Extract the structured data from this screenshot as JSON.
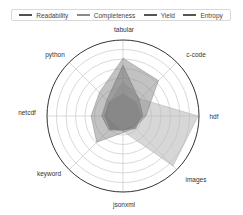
{
  "chart_data": {
    "type": "radar",
    "title": "",
    "categories": [
      "tabular",
      "c-code",
      "hdf",
      "images",
      "jsonxml",
      "keyword",
      "netcdf",
      "python"
    ],
    "rlim": [
      0,
      1
    ],
    "rings": 8,
    "grid": true,
    "legend_position": "top",
    "series": [
      {
        "name": "Readability",
        "color": "#555555",
        "fill": "#5a5a5a",
        "fill_opacity": 0.75,
        "values": [
          0.3,
          0.25,
          0.24,
          0.24,
          0.18,
          0.24,
          0.24,
          0.26
        ]
      },
      {
        "name": "Completeness",
        "color": "#8a8a8a",
        "fill": "#bdbdbd",
        "fill_opacity": 0.6,
        "values": [
          0.45,
          0.32,
          0.99,
          0.93,
          0.2,
          0.16,
          0.22,
          0.25
        ]
      },
      {
        "name": "Yield",
        "color": "#555555",
        "fill": "#8f8f8f",
        "fill_opacity": 0.55,
        "values": [
          0.76,
          0.66,
          0.3,
          0.22,
          0.22,
          0.49,
          0.42,
          0.44
        ]
      },
      {
        "name": "Entropy",
        "color": "#555555",
        "fill": "#777777",
        "fill_opacity": 0.5,
        "values": [
          0.67,
          0.3,
          0.26,
          0.2,
          0.19,
          0.26,
          0.28,
          0.3
        ]
      }
    ]
  },
  "legend": {
    "items": [
      {
        "label": "Readability",
        "color": "#505050"
      },
      {
        "label": "Completeness",
        "color": "#8a8a8a"
      },
      {
        "label": "Yield",
        "color": "#555555"
      },
      {
        "label": "Entropy",
        "color": "#555555"
      }
    ]
  },
  "axes": {
    "labels": [
      "tabular",
      "c-code",
      "hdf",
      "images",
      "jsonxml",
      "keyword",
      "netcdf",
      "python"
    ]
  }
}
